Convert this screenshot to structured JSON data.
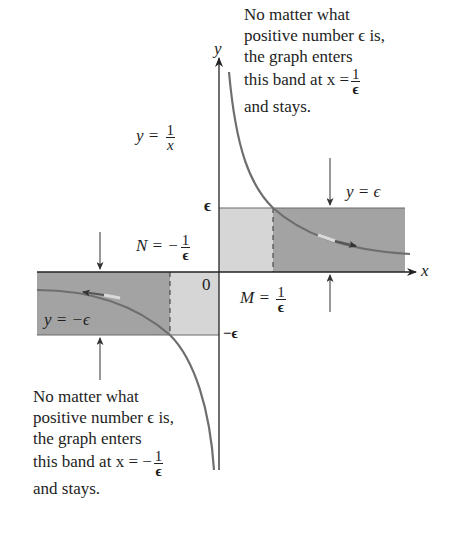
{
  "diagram": {
    "axes": {
      "x_label": "x",
      "y_label": "y",
      "origin_label": "0"
    },
    "function_label": {
      "lhs": "y =",
      "num": "1",
      "den": "x"
    },
    "tick_labels": {
      "eps": "ϵ",
      "neg_eps": "−ϵ"
    },
    "bands": {
      "upper": {
        "label": "y = ϵ",
        "marker_label": {
          "lhs": "M =",
          "num": "1",
          "den": "ϵ"
        }
      },
      "lower": {
        "label": "y = −ϵ",
        "marker_label": {
          "lhs": "N = −",
          "num": "1",
          "den": "ϵ"
        }
      }
    },
    "annotations": {
      "top": {
        "lines": [
          "No matter what",
          "positive number ϵ is,",
          "the graph enters",
          "this band at x ="
        ],
        "frac_num": "1",
        "frac_den": "ϵ",
        "last": "and stays."
      },
      "bottom": {
        "lines": [
          "No matter what",
          "positive number ϵ is,",
          "the graph enters",
          "this band at x = −"
        ],
        "frac_num": "1",
        "frac_den": "ϵ",
        "last": "and stays."
      }
    },
    "colors": {
      "band_dark": "#a3a3a3",
      "band_light": "#d6d6d6",
      "curve": "#6e6e6e",
      "axis": "#222222"
    }
  }
}
